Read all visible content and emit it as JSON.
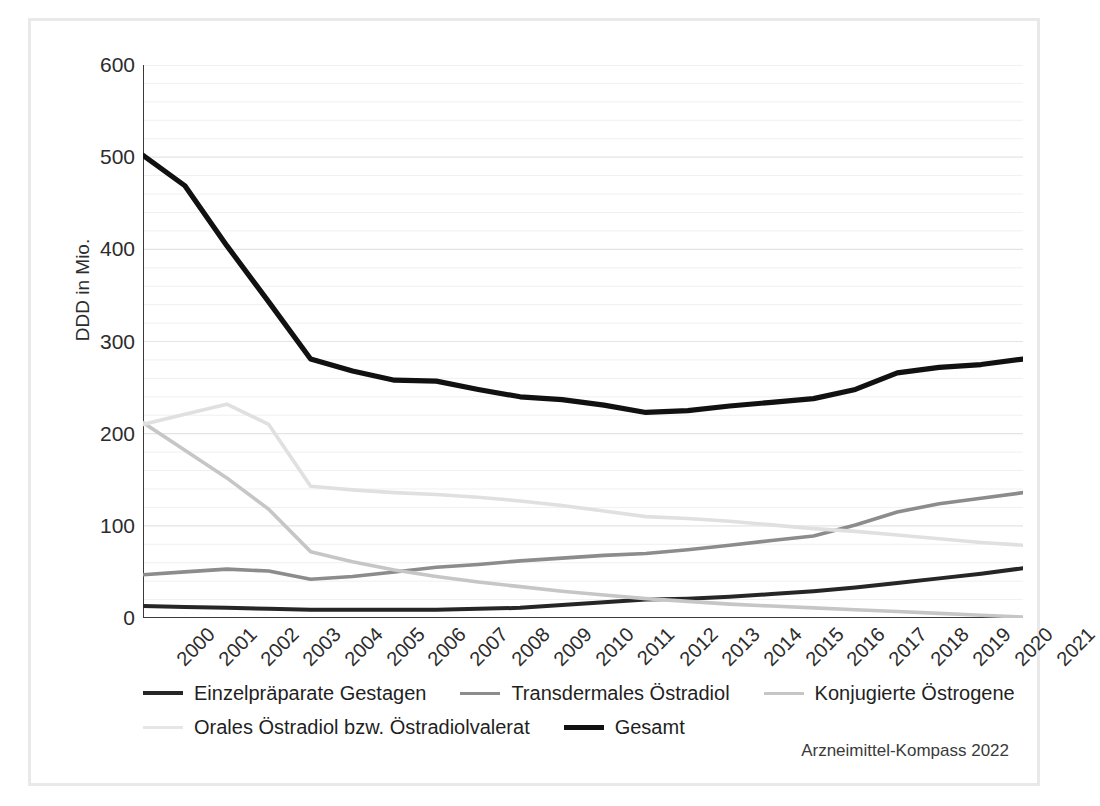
{
  "chart_data": {
    "type": "line",
    "title": "",
    "xlabel": "",
    "ylabel": "DDD in Mio.",
    "ylim": [
      0,
      600
    ],
    "yticks": [
      0,
      100,
      200,
      300,
      400,
      500,
      600
    ],
    "minor_tick_step": 20,
    "grid": "horizontal-minor-and-major",
    "legend_position": "bottom",
    "categories": [
      "2000",
      "2001",
      "2002",
      "2003",
      "2004",
      "2005",
      "2006",
      "2007",
      "2008",
      "2009",
      "2010",
      "2011",
      "2012",
      "2013",
      "2014",
      "2015",
      "2016",
      "2017",
      "2018",
      "2019",
      "2020",
      "2021"
    ],
    "series": [
      {
        "name": "Einzelpräparate Gestagen",
        "color": "#262626",
        "width": 4.0,
        "values": [
          13,
          12,
          11,
          10,
          9,
          9,
          9,
          9,
          10,
          11,
          14,
          17,
          20,
          21,
          23,
          26,
          29,
          33,
          38,
          43,
          48,
          54
        ]
      },
      {
        "name": "Transdermales Östradiol",
        "color": "#8c8c8c",
        "width": 3.6,
        "values": [
          47,
          50,
          53,
          51,
          42,
          45,
          50,
          55,
          58,
          62,
          65,
          68,
          70,
          74,
          79,
          84,
          89,
          101,
          115,
          124,
          130,
          136
        ]
      },
      {
        "name": "Konjugierte Östrogene",
        "color": "#c6c6c6",
        "width": 3.6,
        "values": [
          212,
          182,
          152,
          118,
          72,
          61,
          52,
          45,
          39,
          34,
          29,
          25,
          21,
          18,
          15,
          13,
          11,
          9,
          7,
          5,
          3,
          1
        ]
      },
      {
        "name": "Orales Östradiol bzw. Östradiolvalerat",
        "color": "#e0e0e0",
        "width": 3.6,
        "values": [
          210,
          221,
          232,
          210,
          143,
          139,
          136,
          134,
          131,
          127,
          122,
          116,
          110,
          108,
          105,
          101,
          97,
          94,
          90,
          86,
          82,
          79
        ]
      },
      {
        "name": "Gesamt",
        "color": "#111111",
        "width": 5.2,
        "values": [
          502,
          469,
          404,
          343,
          281,
          268,
          258,
          257,
          248,
          240,
          237,
          231,
          223,
          225,
          230,
          234,
          238,
          248,
          266,
          272,
          275,
          281
        ]
      }
    ]
  },
  "axis": {
    "y_label": "DDD in Mio.",
    "y_tick_labels": [
      "0",
      "100",
      "200",
      "300",
      "400",
      "500",
      "600"
    ]
  },
  "legend": {
    "row1": [
      {
        "label": "Einzelpräparate Gestagen",
        "color": "#262626",
        "width": 4.5
      },
      {
        "label": "Transdermales Östradiol",
        "color": "#8c8c8c",
        "width": 3.6
      },
      {
        "label": "Konjugierte Östrogene",
        "color": "#c6c6c6",
        "width": 3.6
      }
    ],
    "row2": [
      {
        "label": "Orales Östradiol bzw. Östradiolvalerat",
        "color": "#e6e6e6",
        "width": 3.2
      },
      {
        "label": "Gesamt",
        "color": "#111111",
        "width": 5.0
      }
    ]
  },
  "source": {
    "text": "Arzneimittel-Kompass 2022"
  }
}
